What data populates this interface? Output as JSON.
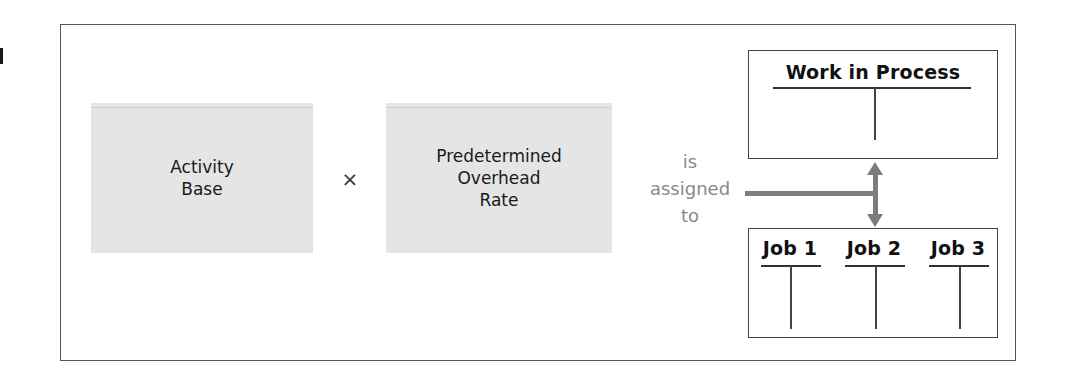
{
  "diagram": {
    "factor_1": {
      "label": "Activity\nBase"
    },
    "operator": {
      "symbol": "×"
    },
    "factor_2": {
      "label": "Predetermined\nOverhead\nRate"
    },
    "connector": {
      "label": "is\nassigned\nto"
    },
    "destination_account": {
      "title": "Work in Process"
    },
    "subsidiary_accounts": [
      {
        "title": "Job 1"
      },
      {
        "title": "Job 2"
      },
      {
        "title": "Job 3"
      }
    ],
    "colors": {
      "box_fill": "#e5e5e5",
      "connector_text": "#8a8a8a",
      "arrow": "#7d7d7d",
      "border": "#444444"
    }
  }
}
